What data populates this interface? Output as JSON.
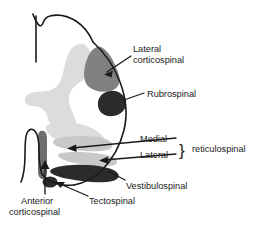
{
  "figure": {
    "background_color": "#ffffff",
    "outline_color": "#1a1a1a",
    "labels": {
      "lateral_corticospinal_line1": "Lateral",
      "lateral_corticospinal_line2": "corticospinal",
      "rubrospinal": "Rubrospinal",
      "medial": "Medial",
      "lateral": "Lateral",
      "reticulospinal": "reticulospinal",
      "brace": "}",
      "vestibulospinal": "Vestibulospinal",
      "tectospinal": "Tectospinal",
      "anterior_corticospinal_line1": "Anterior",
      "anterior_corticospinal_line2": "corticospinal"
    },
    "structures": [
      {
        "name": "gray-matter",
        "label": "gray matter",
        "color": "#dcdcdc"
      },
      {
        "name": "lateral-corticospinal-tract",
        "label": "Lateral corticospinal",
        "color": "#808080"
      },
      {
        "name": "rubrospinal-tract",
        "label": "Rubrospinal",
        "color": "#2b2b2b"
      },
      {
        "name": "medial-reticulospinal-tract",
        "label": "Medial reticulospinal",
        "color": "#c8c8c8"
      },
      {
        "name": "lateral-reticulospinal-tract",
        "label": "Lateral reticulospinal",
        "color": "#c8c8c8"
      },
      {
        "name": "vestibulospinal-tract",
        "label": "Vestibulospinal",
        "color": "#2b2b2b"
      },
      {
        "name": "tectospinal-tract",
        "label": "Tectospinal",
        "color": "#2b2b2b"
      },
      {
        "name": "anterior-corticospinal-tract",
        "label": "Anterior corticospinal",
        "color": "#6e6e6e"
      }
    ]
  }
}
